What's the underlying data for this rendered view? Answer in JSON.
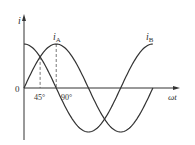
{
  "diagram": {
    "type": "waveform",
    "y_axis_label": "i",
    "x_axis_label": "ωt",
    "origin_label": "0",
    "tick_labels": [
      "45°",
      "90°"
    ],
    "tick_degrees": [
      45,
      90
    ],
    "series": [
      {
        "name": "i_A",
        "label_main": "i",
        "label_sub": "A",
        "function": "sin",
        "phase_deg": 0
      },
      {
        "name": "i_B",
        "label_main": "i",
        "label_sub": "B",
        "function": "cos",
        "phase_deg": 90
      }
    ],
    "x_range_deg": [
      0,
      360
    ],
    "colors": {
      "line": "#333333",
      "dash": "#555555"
    }
  }
}
